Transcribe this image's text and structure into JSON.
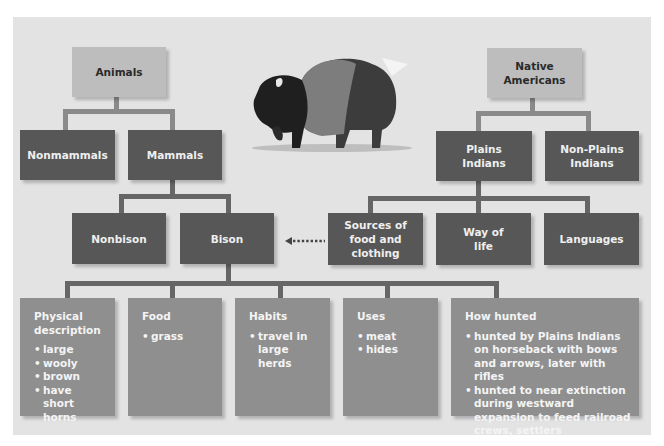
{
  "diagram": {
    "type": "hierarchy",
    "illustration": "bison-illustration",
    "colors": {
      "page_bg": "#ffffff",
      "panel_bg": "#e3e3e3",
      "root_box": "#bdbdbd",
      "category_box": "#575757",
      "detail_box": "#8f8f8f",
      "connector": "#666666"
    },
    "left_tree": {
      "root": "Animals",
      "level1": [
        "Nonmammals",
        "Mammals"
      ],
      "level2": [
        "Nonbison",
        "Bison"
      ]
    },
    "right_tree": {
      "root": "Native Americans",
      "level1": [
        "Plains Indians",
        "Non-Plains Indians"
      ],
      "level2": [
        "Sources of food and clothing",
        "Way of life",
        "Languages"
      ]
    },
    "link": {
      "from": "Sources of food and clothing",
      "to": "Bison",
      "style": "dotted-arrow"
    },
    "details": [
      {
        "title": "Physical description",
        "items": [
          "large",
          "wooly",
          "brown",
          "have short horns"
        ]
      },
      {
        "title": "Food",
        "items": [
          "grass"
        ]
      },
      {
        "title": "Habits",
        "items": [
          "travel in large herds"
        ]
      },
      {
        "title": "Uses",
        "items": [
          "meat",
          "hides"
        ]
      },
      {
        "title": "How hunted",
        "items": [
          "hunted by Plains Indians on horseback with bows and arrows, later with rifles",
          "hunted to near extinction during westward expansion to feed railroad crews, settlers"
        ]
      }
    ]
  }
}
